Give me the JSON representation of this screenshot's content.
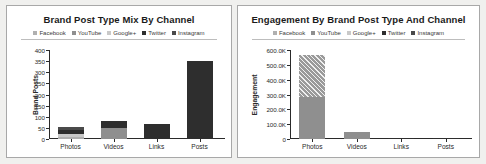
{
  "colors": {
    "facebook": "#b0b0b0",
    "youtube": "#8f8f8f",
    "googleplus": "#c9c9c9",
    "twitter": "#2e2e2e",
    "instagram": "#4a4a4a",
    "axis": "#2a2a2a",
    "panel_border": "#a8a8a8",
    "page_background": "#f0f0ee"
  },
  "legend_labels": [
    "Facebook",
    "YouTube",
    "Google+",
    "Twitter",
    "Instagram"
  ],
  "charts": [
    {
      "id": "brand-post-type-mix",
      "title": "Brand Post Type Mix By Channel"
    },
    {
      "id": "engagement-by-brand-post-type",
      "title": "Engagement By Brand Post Type And Channel"
    }
  ],
  "chart_data": [
    {
      "type": "bar",
      "stacked": true,
      "title": "Brand Post Type Mix By Channel",
      "xlabel": "",
      "ylabel": "Brand Posts",
      "categories": [
        "Photos",
        "Videos",
        "Links",
        "Posts"
      ],
      "ylim": [
        0,
        400
      ],
      "yticks": [
        0,
        50,
        100,
        150,
        200,
        250,
        300,
        350,
        400
      ],
      "ytick_labels": [
        "0",
        "50",
        "100",
        "150",
        "200",
        "250",
        "300",
        "350",
        "400"
      ],
      "grid": false,
      "legend": [
        "Facebook",
        "YouTube",
        "Google+",
        "Twitter",
        "Instagram"
      ],
      "legend_position": "top",
      "series": [
        {
          "name": "Facebook",
          "values": [
            10,
            0,
            0,
            0
          ]
        },
        {
          "name": "YouTube",
          "values": [
            0,
            50,
            0,
            0
          ]
        },
        {
          "name": "Google+",
          "values": [
            14,
            0,
            0,
            0
          ]
        },
        {
          "name": "Twitter",
          "values": [
            18,
            32,
            66,
            352
          ]
        },
        {
          "name": "Instagram",
          "values": [
            10,
            0,
            0,
            0
          ]
        }
      ],
      "totals": [
        52,
        82,
        66,
        352
      ]
    },
    {
      "type": "bar",
      "stacked": true,
      "title": "Engagement By Brand Post Type And Channel",
      "xlabel": "",
      "ylabel": "Engagement",
      "categories": [
        "Photos",
        "Videos",
        "Links",
        "Posts"
      ],
      "ylim": [
        0,
        600000
      ],
      "yticks": [
        0,
        100000,
        200000,
        300000,
        400000,
        500000,
        600000
      ],
      "ytick_labels": [
        "0",
        "100.0K",
        "200.0K",
        "300.0K",
        "400.0K",
        "500.0K",
        "600.0K"
      ],
      "grid": false,
      "legend": [
        "Facebook",
        "YouTube",
        "Google+",
        "Twitter",
        "Instagram"
      ],
      "legend_position": "top",
      "series": [
        {
          "name": "YouTube",
          "values": [
            285000,
            45000,
            0,
            0
          ]
        },
        {
          "name": "Google+",
          "values": [
            280000,
            0,
            0,
            0
          ]
        },
        {
          "name": "Twitter",
          "values": [
            0,
            0,
            1500,
            8000
          ]
        }
      ],
      "totals": [
        565000,
        45000,
        1500,
        8000
      ]
    }
  ]
}
